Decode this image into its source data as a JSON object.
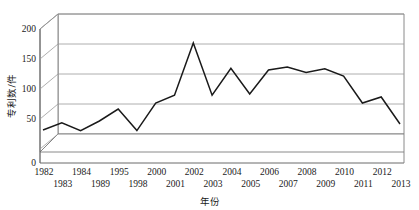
{
  "chart_data": {
    "type": "line",
    "title": "",
    "xlabel": "年份",
    "ylabel": "专利数/件",
    "ylim": [
      0,
      200
    ],
    "yticks": [
      0,
      50,
      100,
      150,
      200
    ],
    "grid": true,
    "legend": "none",
    "style": "3d-perspective-line",
    "categories": [
      "1982",
      "1983",
      "1984",
      "1989",
      "1995",
      "1998",
      "2000",
      "2001",
      "2002",
      "2003",
      "2004",
      "2005",
      "2006",
      "2007",
      "2008",
      "2009",
      "2010",
      "2011",
      "2012",
      "2013"
    ],
    "values": [
      30,
      42,
      29,
      45,
      65,
      29,
      75,
      88,
      175,
      88,
      133,
      90,
      130,
      135,
      126,
      132,
      120,
      75,
      85,
      40
    ],
    "series": [
      {
        "name": "专利数",
        "values": [
          30,
          42,
          29,
          45,
          65,
          29,
          75,
          88,
          175,
          88,
          133,
          90,
          130,
          135,
          126,
          132,
          120,
          75,
          85,
          40
        ]
      }
    ],
    "line_color": "#1a1a1a",
    "grid_color": "#9a9a9a",
    "axis_color": "#6b6b6b"
  },
  "labels": {
    "y_title": "专利数/件",
    "x_title": "年份",
    "y_ticks": [
      "200",
      "150",
      "100",
      "50",
      "0"
    ],
    "x_ticks_upper": [
      "1982",
      "1984",
      "1995",
      "2000",
      "2002",
      "2004",
      "2006",
      "2008",
      "2010",
      "2012"
    ],
    "x_ticks_lower": [
      "1983",
      "1989",
      "1998",
      "2001",
      "2003",
      "2005",
      "2007",
      "2009",
      "2011",
      "2013"
    ]
  }
}
